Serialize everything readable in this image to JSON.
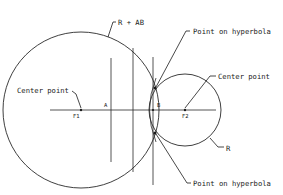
{
  "diagram": {
    "labels": {
      "big_radius": "R + AB",
      "point_top": "Point on hyperbola",
      "center_left": "Center point",
      "center_right": "Center point",
      "small_radius": "R",
      "point_bottom": "Point on hyperbola",
      "focus1": "F1",
      "focus2": "F2",
      "vertex_a": "A",
      "vertex_b": "B"
    },
    "colors": {
      "line": "#2a2a2a",
      "background": "#ffffff"
    }
  }
}
